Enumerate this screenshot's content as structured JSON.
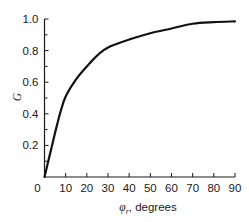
{
  "chart_data": {
    "type": "line",
    "title": "",
    "xlabel": "φr, degrees",
    "xlabel_symbol": "φ",
    "xlabel_subscript": "r",
    "xlabel_unit": ", degrees",
    "ylabel": "G",
    "xlim": [
      0,
      90
    ],
    "ylim": [
      0,
      1.0
    ],
    "grid": false,
    "legend": null,
    "x_ticks": [
      0,
      10,
      20,
      30,
      40,
      50,
      60,
      70,
      80,
      90
    ],
    "x_tick_labels": [
      "0",
      "10",
      "20",
      "30",
      "40",
      "50",
      "60",
      "70",
      "80",
      "90"
    ],
    "y_ticks": [
      0.2,
      0.4,
      0.6,
      0.8,
      1.0
    ],
    "y_tick_labels": [
      "0.2",
      "0.4",
      "0.6",
      "0.8",
      "1.0"
    ],
    "y_minor_ticks": [
      0.1,
      0.3,
      0.5,
      0.7,
      0.9
    ],
    "series": [
      {
        "name": "G",
        "color": "#111111",
        "x": [
          0,
          2.5,
          5,
          7.5,
          10,
          15,
          20,
          25,
          30,
          40,
          50,
          60,
          70,
          80,
          90
        ],
        "values": [
          0,
          0.14,
          0.28,
          0.41,
          0.51,
          0.62,
          0.7,
          0.77,
          0.82,
          0.87,
          0.91,
          0.94,
          0.97,
          0.98,
          0.985
        ]
      }
    ]
  }
}
